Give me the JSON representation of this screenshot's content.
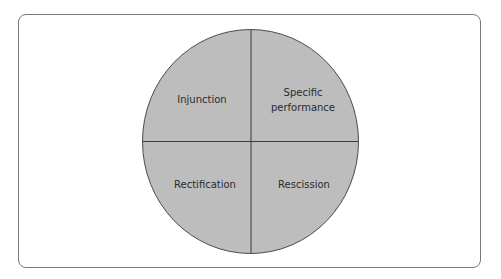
{
  "diagram": {
    "type": "quadrant-circle",
    "colors": {
      "fill": "#bdbdbd",
      "stroke": "#4a4a4a",
      "frame": "#7a7a7a",
      "text": "#2b2b2b"
    },
    "quadrants": [
      {
        "position": "top-left",
        "label": "Injunction"
      },
      {
        "position": "top-right",
        "label_line1": "Specific",
        "label_line2": "performance"
      },
      {
        "position": "bottom-left",
        "label": "Rectification"
      },
      {
        "position": "bottom-right",
        "label": "Rescission"
      }
    ]
  }
}
